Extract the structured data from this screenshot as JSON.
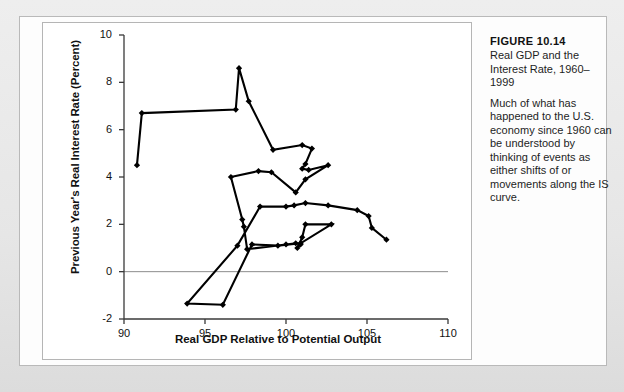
{
  "figure": {
    "number_label": "FIGURE 10.14",
    "subtitle": "Real GDP and the Interest Rate, 1960–1999",
    "body": "Much of what has happened to the U.S. economy since 1960 can be understood by thinking of events as either shifts of or movements along the IS curve."
  },
  "colors": {
    "page_background": "#e8e8e8",
    "panel_background": "#fdfdfd",
    "plot_background": "#ffffff",
    "axis": "#333333",
    "zero_line": "#8c8c8c",
    "series": "#000000",
    "panel_border": "#b5b5b5"
  },
  "chart_data": {
    "type": "line",
    "title": "Real GDP and the Interest Rate, 1960–1999",
    "xlabel": "Real GDP Relative to Potential Output",
    "ylabel": "Previous Year's Real Interest Rate (Percent)",
    "xlim": [
      90,
      110
    ],
    "ylim": [
      -2,
      10
    ],
    "xticks": [
      90,
      95,
      100,
      105,
      110
    ],
    "yticks": [
      -2,
      0,
      2,
      4,
      6,
      8,
      10
    ],
    "grid": false,
    "legend": "none",
    "markers": "diamond",
    "zero_reference_line": 0,
    "series": [
      {
        "name": "IS curve path 1960–1999",
        "points": [
          [
            90.8,
            4.5
          ],
          [
            91.1,
            6.7
          ],
          [
            96.9,
            6.85
          ],
          [
            97.1,
            8.6
          ],
          [
            97.7,
            7.2
          ],
          [
            99.2,
            5.15
          ],
          [
            101.0,
            5.35
          ],
          [
            101.6,
            5.2
          ],
          [
            101.2,
            4.55
          ],
          [
            101.0,
            4.35
          ],
          [
            101.4,
            4.3
          ],
          [
            102.6,
            4.5
          ],
          [
            101.2,
            3.9
          ],
          [
            100.6,
            3.35
          ],
          [
            99.1,
            4.2
          ],
          [
            98.3,
            4.25
          ],
          [
            96.6,
            4.0
          ],
          [
            97.3,
            2.2
          ],
          [
            97.4,
            1.9
          ],
          [
            97.6,
            0.95
          ],
          [
            100.0,
            1.15
          ],
          [
            100.6,
            1.2
          ],
          [
            100.9,
            1.15
          ],
          [
            100.7,
            1.0
          ],
          [
            101.0,
            1.45
          ],
          [
            101.2,
            2.0
          ],
          [
            102.8,
            2.0
          ],
          [
            100.9,
            1.2
          ],
          [
            99.5,
            1.1
          ],
          [
            97.9,
            1.15
          ],
          [
            96.1,
            -1.4
          ],
          [
            93.9,
            -1.35
          ],
          [
            97.0,
            1.1
          ],
          [
            98.4,
            2.75
          ],
          [
            100.0,
            2.75
          ],
          [
            100.5,
            2.8
          ],
          [
            101.2,
            2.9
          ],
          [
            102.6,
            2.8
          ],
          [
            104.4,
            2.6
          ],
          [
            105.1,
            2.35
          ],
          [
            105.3,
            1.85
          ],
          [
            106.2,
            1.35
          ]
        ]
      }
    ]
  }
}
